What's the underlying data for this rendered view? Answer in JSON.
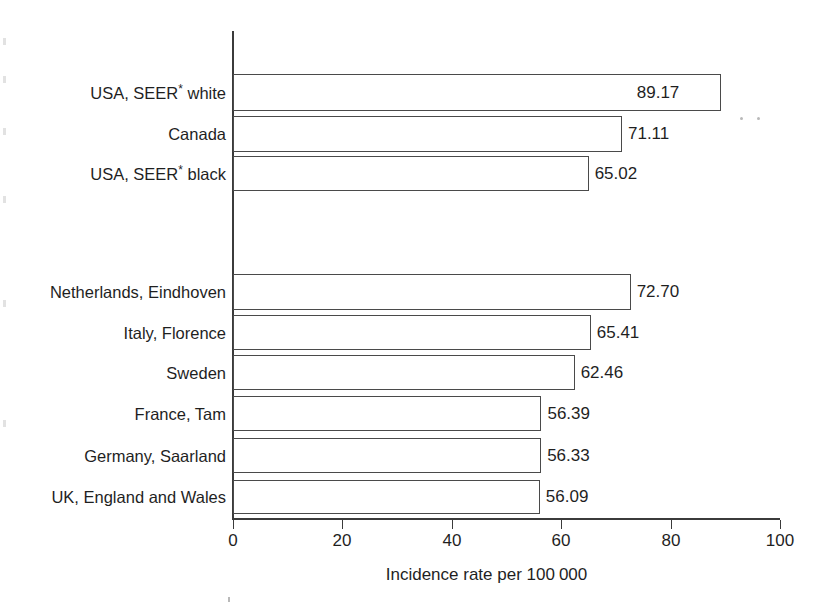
{
  "chart_data": {
    "type": "bar",
    "orientation": "horizontal",
    "title": "",
    "subtitle": "",
    "xlabel": "Incidence rate per 100 000",
    "ylabel": "",
    "xlim": [
      0,
      100
    ],
    "xticks": [
      0,
      20,
      40,
      60,
      80,
      100
    ],
    "xtick_labels": [
      "0",
      "20",
      "40",
      "60",
      "80",
      "100"
    ],
    "grid": false,
    "legend": null,
    "bar_style": {
      "fill": "#ffffff",
      "edge": "#4a4a4a",
      "edge_width": 1
    },
    "groups": [
      {
        "name": "North America",
        "categories": [
          "USA, SEER* white",
          "Canada",
          "USA, SEER* black"
        ],
        "values": [
          89.17,
          71.11,
          65.02
        ],
        "value_labels": [
          "89.17",
          "71.11",
          "65.02"
        ]
      },
      {
        "name": "Europe",
        "categories": [
          "Netherlands, Eindhoven",
          "Italy, Florence",
          "Sweden",
          "France, Tam",
          "Germany, Saarland",
          "UK, England and Wales"
        ],
        "values": [
          72.7,
          65.41,
          62.46,
          56.39,
          56.33,
          56.09
        ],
        "value_labels": [
          "72.70",
          "65.41",
          "62.46",
          "56.39",
          "56.33",
          "56.09"
        ]
      }
    ],
    "categories": [
      "USA, SEER* white",
      "Canada",
      "USA, SEER* black",
      "Netherlands, Eindhoven",
      "Italy, Florence",
      "Sweden",
      "France, Tam",
      "Germany, Saarland",
      "UK, England and Wales"
    ],
    "values": [
      89.17,
      71.11,
      65.02,
      72.7,
      65.41,
      62.46,
      56.39,
      56.33,
      56.09
    ],
    "footnote": "*"
  },
  "bars": [
    {
      "label": "USA, SEER* white",
      "label_main": "USA, SEER",
      "label_sup": "*",
      "label_tail": " white",
      "value": 89.17,
      "value_label": "89.17",
      "top": 74,
      "height": 37,
      "label_inside": true
    },
    {
      "label": "Canada",
      "label_main": "Canada",
      "label_sup": "",
      "label_tail": "",
      "value": 71.11,
      "value_label": "71.11",
      "top": 116,
      "height": 36,
      "label_inside": false
    },
    {
      "label": "USA, SEER* black",
      "label_main": "USA, SEER",
      "label_sup": "*",
      "label_tail": " black",
      "value": 65.02,
      "value_label": "65.02",
      "top": 156,
      "height": 35,
      "label_inside": false
    },
    {
      "label": "Netherlands, Eindhoven",
      "label_main": "Netherlands, Eindhoven",
      "label_sup": "",
      "label_tail": "",
      "value": 72.7,
      "value_label": "72.70",
      "top": 274,
      "height": 36,
      "label_inside": false
    },
    {
      "label": "Italy, Florence",
      "label_main": "Italy, Florence",
      "label_sup": "",
      "label_tail": "",
      "value": 65.41,
      "value_label": "65.41",
      "top": 315,
      "height": 35,
      "label_inside": false
    },
    {
      "label": "Sweden",
      "label_main": "Sweden",
      "label_sup": "",
      "label_tail": "",
      "value": 62.46,
      "value_label": "62.46",
      "top": 355,
      "height": 35,
      "label_inside": false
    },
    {
      "label": "France, Tam",
      "label_main": "France, Tam",
      "label_sup": "",
      "label_tail": "",
      "value": 56.39,
      "value_label": "56.39",
      "top": 396,
      "height": 35,
      "label_inside": false
    },
    {
      "label": "Germany, Saarland",
      "label_main": "Germany, Saarland",
      "label_sup": "",
      "label_tail": "",
      "value": 56.33,
      "value_label": "56.33",
      "top": 438,
      "height": 35,
      "label_inside": false
    },
    {
      "label": "UK, England and Wales",
      "label_main": "UK, England and Wales",
      "label_sup": "",
      "label_tail": "",
      "value": 56.09,
      "value_label": "56.09",
      "top": 480,
      "height": 34,
      "label_inside": false
    }
  ],
  "axis": {
    "ticks": [
      {
        "value": 0,
        "label": "0"
      },
      {
        "value": 20,
        "label": "20"
      },
      {
        "value": 40,
        "label": "40"
      },
      {
        "value": 60,
        "label": "60"
      },
      {
        "value": 80,
        "label": "80"
      },
      {
        "value": 100,
        "label": "100"
      }
    ],
    "title_prefix": "Incidence rate per 100",
    "title_suffix": "000",
    "title": "Incidence rate per 100 000"
  }
}
